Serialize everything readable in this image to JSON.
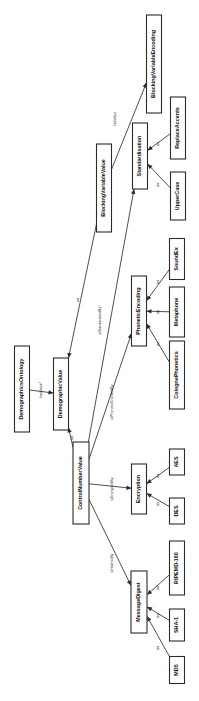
{
  "diagram": {
    "title": "DemographicsOntology",
    "orientation": "rotated-90-clockwise",
    "nodes": [
      {
        "id": "DemographicsOntology",
        "label": "DemographicsOntology",
        "cx": 22,
        "cy": 389,
        "w": 15,
        "h": 86,
        "font": 5.4
      },
      {
        "id": "DemographicValue",
        "label": "DemographicValue",
        "cx": 61,
        "cy": 394,
        "w": 15,
        "h": 72,
        "font": 5.4
      },
      {
        "id": "BlockingVariableValue",
        "label": "BlockingVariableValue",
        "cx": 104,
        "cy": 188,
        "w": 15,
        "h": 88,
        "font": 5.4
      },
      {
        "id": "ControlNumberValue",
        "label": "ControlNumberValue",
        "cx": 81,
        "cy": 483,
        "w": 16,
        "h": 82,
        "font": 5.4
      },
      {
        "id": "BlockingVariableEncoding",
        "label": "BlockingVariableEncoding",
        "cx": 154,
        "cy": 64,
        "w": 15,
        "h": 98,
        "font": 5.4
      },
      {
        "id": "Standardisation",
        "label": "Standardisation",
        "cx": 140,
        "cy": 156,
        "w": 15,
        "h": 66,
        "font": 5.4
      },
      {
        "id": "ReplaceAccents",
        "label": "ReplaceAccents",
        "cx": 178,
        "cy": 128,
        "w": 15,
        "h": 62,
        "font": 5.4
      },
      {
        "id": "UpperCase",
        "label": "UpperCase",
        "cx": 178,
        "cy": 196,
        "w": 15,
        "h": 48,
        "font": 5.4
      },
      {
        "id": "PhoneticEncoding",
        "label": "PhoneticEncoding",
        "cx": 139,
        "cy": 311,
        "w": 15,
        "h": 70,
        "font": 5.4
      },
      {
        "id": "SoundEx",
        "label": "SoundEx",
        "cx": 177,
        "cy": 259,
        "w": 15,
        "h": 41,
        "font": 5.4
      },
      {
        "id": "Metaphone",
        "label": "Metaphone",
        "cx": 177,
        "cy": 312,
        "w": 15,
        "h": 50,
        "font": 5.4
      },
      {
        "id": "ColognePhonetics",
        "label": "ColognePhonetics",
        "cx": 177,
        "cy": 375,
        "w": 15,
        "h": 68,
        "font": 5.4
      },
      {
        "id": "Encryption",
        "label": "Encryption",
        "cx": 139,
        "cy": 489,
        "w": 15,
        "h": 50,
        "font": 5.4
      },
      {
        "id": "AES",
        "label": "AES",
        "cx": 177,
        "cy": 462,
        "w": 15,
        "h": 26,
        "font": 5.4
      },
      {
        "id": "DES",
        "label": "DES",
        "cx": 177,
        "cy": 511,
        "w": 15,
        "h": 26,
        "font": 5.4
      },
      {
        "id": "MessageDigest",
        "label": "MessageDigest",
        "cx": 139,
        "cy": 602,
        "w": 16,
        "h": 62,
        "font": 5.4
      },
      {
        "id": "RIPEMD-160",
        "label": "RIPEMD-160",
        "cx": 177,
        "cy": 568,
        "w": 15,
        "h": 54,
        "font": 5.4
      },
      {
        "id": "SHA-1",
        "label": "SHA-1",
        "cx": 177,
        "cy": 625,
        "w": 15,
        "h": 32,
        "font": 5.4
      },
      {
        "id": "MD5",
        "label": "MD5",
        "cx": 177,
        "cy": 670,
        "w": 15,
        "h": 27,
        "font": 5.4
      }
    ],
    "edges": [
      {
        "from": "DemographicsOntology",
        "to": "DemographicValue",
        "label": "hasValue*",
        "label_x": 41,
        "label_y": 390,
        "lfont": 3.6
      },
      {
        "from": "BlockingVariableValue",
        "to": "DemographicValue",
        "label": "isa",
        "label_x": 78,
        "label_y": 300,
        "lfont": 3.6
      },
      {
        "from": "ControlNumberValue",
        "to": "DemographicValue",
        "label": "isa",
        "label_x": 72,
        "label_y": 438,
        "lfont": 3.6
      },
      {
        "from": "BlockingVariableValue",
        "to": "BlockingVariableEncoding",
        "label": "hasValue",
        "label_x": 115,
        "label_y": 119,
        "lfont": 3.6
      },
      {
        "from": "ControlNumberValue",
        "to": "Standardisation",
        "label": "isStandardisedBy*",
        "label_x": 100,
        "label_y": 320,
        "lfont": 3.6
      },
      {
        "from": "ReplaceAccents",
        "to": "Standardisation",
        "label": "isa",
        "label_x": 158,
        "label_y": 144,
        "lfont": 3.6
      },
      {
        "from": "UpperCase",
        "to": "Standardisation",
        "label": "isa",
        "label_x": 158,
        "label_y": 185,
        "lfont": 3.6
      },
      {
        "from": "ControlNumberValue",
        "to": "PhoneticEncoding",
        "label": "isPhoneticEncodedBy",
        "label_x": 112,
        "label_y": 402,
        "lfont": 3.6
      },
      {
        "from": "SoundEx",
        "to": "PhoneticEncoding",
        "label": "isa",
        "label_x": 158,
        "label_y": 282,
        "lfont": 3.6
      },
      {
        "from": "Metaphone",
        "to": "PhoneticEncoding",
        "label": "isa",
        "label_x": 158,
        "label_y": 312,
        "lfont": 3.6
      },
      {
        "from": "ColognePhonetics",
        "to": "PhoneticEncoding",
        "label": "isa",
        "label_x": 158,
        "label_y": 344,
        "lfont": 3.6
      },
      {
        "from": "ControlNumberValue",
        "to": "Encryption",
        "label": "isEncryptedBy",
        "label_x": 112,
        "label_y": 489,
        "lfont": 3.6
      },
      {
        "from": "AES",
        "to": "Encryption",
        "label": "isa",
        "label_x": 158,
        "label_y": 476,
        "lfont": 3.6
      },
      {
        "from": "DES",
        "to": "Encryption",
        "label": "isa",
        "label_x": 158,
        "label_y": 504,
        "lfont": 3.6
      },
      {
        "from": "ControlNumberValue",
        "to": "MessageDigest",
        "label": "isHashedBy",
        "label_x": 112,
        "label_y": 563,
        "lfont": 3.6
      },
      {
        "from": "RIPEMD-160",
        "to": "MessageDigest",
        "label": "isa",
        "label_x": 158,
        "label_y": 588,
        "lfont": 3.6
      },
      {
        "from": "SHA-1",
        "to": "MessageDigest",
        "label": "isa",
        "label_x": 158,
        "label_y": 616,
        "lfont": 3.6
      },
      {
        "from": "MD5",
        "to": "MessageDigest",
        "label": "isa",
        "label_x": 158,
        "label_y": 648,
        "lfont": 3.6
      }
    ],
    "colors": {
      "background": "#ffffff",
      "node_fill": "#ffffff",
      "node_stroke": "#2b2b2b",
      "edge_stroke": "#3a3a3a",
      "text": "#111111"
    }
  }
}
